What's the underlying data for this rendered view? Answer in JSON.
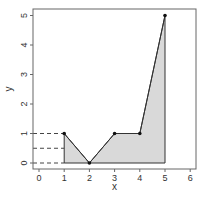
{
  "chart_data": {
    "type": "area",
    "title": "",
    "xlabel": "x",
    "ylabel": "y",
    "xlim": [
      -0.25,
      6.25
    ],
    "ylim": [
      -0.2,
      5.2
    ],
    "grid": false,
    "legend": null,
    "x_ticks": [
      "0",
      "1",
      "2",
      "3",
      "4",
      "5",
      "6"
    ],
    "y_ticks": [
      "0",
      "1",
      "2",
      "3",
      "4",
      "5"
    ],
    "series": [
      {
        "name": "polyline",
        "x": [
          1,
          2,
          3,
          4,
          5
        ],
        "y": [
          1,
          0,
          1,
          1,
          5
        ]
      }
    ],
    "fill": {
      "description": "Shaded region between polyline and y=0 from x=1 to x=5",
      "color": "#d9d9d9"
    },
    "reference_lines": [
      {
        "type": "dashed-horizontal",
        "y": 1,
        "x_from": "left-edge",
        "x_to": 1
      },
      {
        "type": "dashed-horizontal",
        "y": 0.5,
        "x_from": "left-edge",
        "x_to": 1
      },
      {
        "type": "dashed-horizontal",
        "y": 0,
        "x_from": "left-edge",
        "x_to": 1
      }
    ]
  },
  "colors": {
    "axis": "#555555",
    "line": "#333333",
    "fill": "#d9d9d9",
    "points": "#111111"
  }
}
